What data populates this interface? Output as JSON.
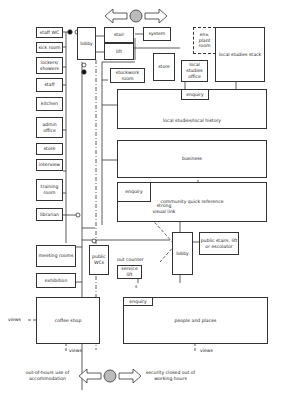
{
  "rooms": {
    "staff_wc": "staff WC",
    "sick_room": "sick room",
    "lockers": "lockers/\nshowers",
    "staff": "staff",
    "kitchen": "kitchen",
    "admin_office": "admin office",
    "store_left": "store",
    "interview": "interview",
    "training_room": "training room",
    "librarian": "librarian",
    "lobby_top": "lobby",
    "stair": "stair",
    "lift": "lift",
    "system": "system",
    "env_plant_room": "env. plant room",
    "local_studies_stack": "local studies stack",
    "store_top": "store",
    "local_studies_office": "local studies office",
    "stockwork_room": "stockwork room",
    "enquiry_local": "enquiry",
    "local_studies_history": "local studies/local history",
    "business": "business",
    "enquiry_cqr": "enquiry",
    "community_quick_reference": "community quick reference",
    "public_stairs": "public stairs, lift or escolator",
    "lobby_bottom": "lobby",
    "meeting_rooms": "meeting rooms",
    "public_wcs": "public WCs",
    "exhibition": "exhibition",
    "out_counter": "out counter",
    "service_lift": "service lift",
    "enquiry_people": "enquiry",
    "coffee_shop": "coffee shop",
    "people_and_places": "people and places"
  },
  "annotations": {
    "strong_visual_link": "strong visual link",
    "views_left": "views",
    "views_coffee": "views",
    "views_people": "views",
    "s_label": "s",
    "out_of_hours": "out-of-hours use of accommodation",
    "security_closed": "security closed out of working hours"
  }
}
